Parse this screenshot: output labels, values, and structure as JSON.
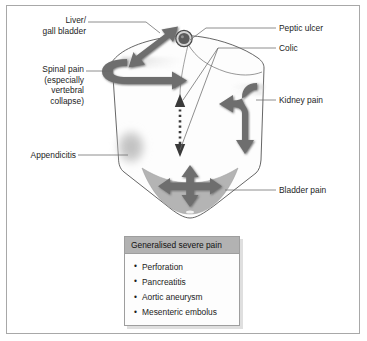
{
  "diagram": {
    "labels": {
      "liver": "Liver/\ngall bladder",
      "spinal": "Spinal pain\n(especially\nvertebral\ncollapse)",
      "appendicitis": "Appendicitis",
      "peptic_ulcer": "Peptic ulcer",
      "colic": "Colic",
      "kidney": "Kidney pain",
      "bladder": "Bladder pain"
    },
    "markers": {
      "liver_arrow": "double-headed-arrow",
      "spinal_arrow": "hooked-arrow",
      "appendicitis_blob": "soft-gray-oval",
      "peptic_ulcer_dot": "filled-circle-marker",
      "colic_arrow": "dotted-double-headed-arrow",
      "kidney_arrow": "s-curve-double-arrow",
      "bladder_arrow": "four-way-cross-arrow",
      "bladder_region": "gray-wedge"
    }
  },
  "legend": {
    "header": "Generalised severe pain",
    "items": [
      "Perforation",
      "Pancreatitis",
      "Aortic aneurysm",
      "Mesenteric embolus"
    ]
  },
  "colors": {
    "frame_border": "#a8a8a8",
    "arrow_gray": "#6e6e6e",
    "arrow_gray_light": "#8d8d8d",
    "body_outline": "#4a4a4a",
    "bladder_fill": "#b4b4b4",
    "appendix_blob": "#bfbfbf",
    "legend_header_bg": "#b2b2b2",
    "text": "#1c1c1c",
    "leader_line": "#6a6a6a"
  }
}
